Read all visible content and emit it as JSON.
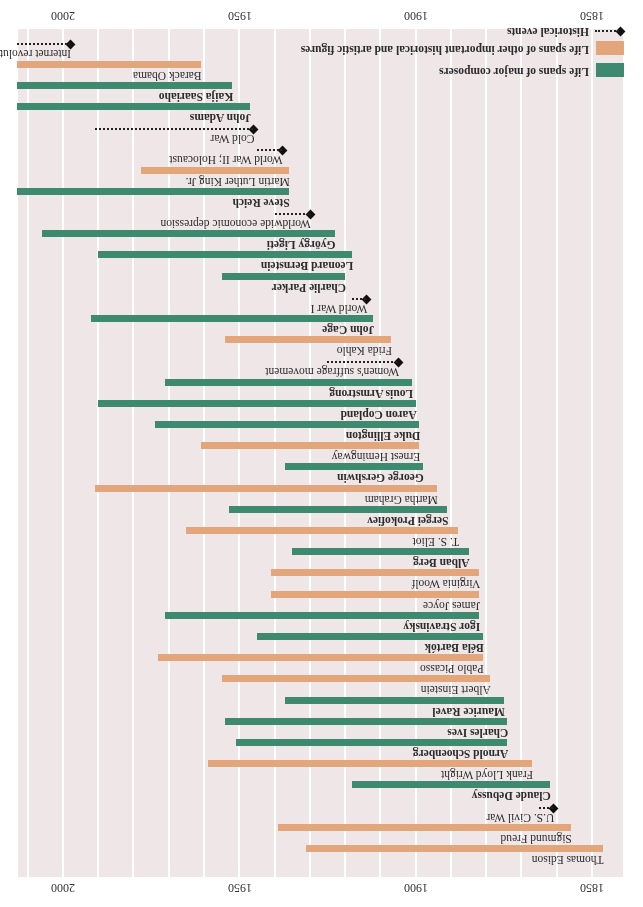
{
  "chart_data": {
    "type": "timeline",
    "title": "",
    "orientation_note": "rendered rotated 180 degrees",
    "xlabel": "",
    "ylabel": "",
    "x_range": [
      1842,
      2014
    ],
    "ticks": [
      1850,
      1900,
      1950,
      2000
    ],
    "grid_step_years": 10,
    "grid": true,
    "legend": [
      {
        "key": "composer",
        "label": "Life spans of major composers",
        "color": "#3d8a70"
      },
      {
        "key": "other",
        "label": "Life spans of other important historical and artistic figures",
        "color": "#e3a57a"
      },
      {
        "key": "event",
        "label": "Historical events",
        "color": "#111111"
      }
    ],
    "rows": [
      {
        "label": "Thomas Edison",
        "kind": "other",
        "start": 1847,
        "end": 1931
      },
      {
        "label": "Sigmund Freud",
        "kind": "other",
        "start": 1856,
        "end": 1939
      },
      {
        "label": "U.S. Civil War",
        "kind": "event",
        "start": 1861,
        "end": 1865
      },
      {
        "label": "Claude Debussy",
        "kind": "composer",
        "start": 1862,
        "end": 1918
      },
      {
        "label": "Frank Lloyd Wright",
        "kind": "other",
        "start": 1867,
        "end": 1959
      },
      {
        "label": "Arnold Schoenberg",
        "kind": "composer",
        "start": 1874,
        "end": 1951
      },
      {
        "label": "Charles Ives",
        "kind": "composer",
        "start": 1874,
        "end": 1954
      },
      {
        "label": "Maurice Ravel",
        "kind": "composer",
        "start": 1875,
        "end": 1937
      },
      {
        "label": "Albert Einstein",
        "kind": "other",
        "start": 1879,
        "end": 1955
      },
      {
        "label": "Pablo Picasso",
        "kind": "other",
        "start": 1881,
        "end": 1973
      },
      {
        "label": "Béla Bartók",
        "kind": "composer",
        "start": 1881,
        "end": 1945
      },
      {
        "label": "Igor Stravinsky",
        "kind": "composer",
        "start": 1882,
        "end": 1971
      },
      {
        "label": "James Joyce",
        "kind": "other",
        "start": 1882,
        "end": 1941
      },
      {
        "label": "Virginia Woolf",
        "kind": "other",
        "start": 1882,
        "end": 1941
      },
      {
        "label": "Alban Berg",
        "kind": "composer",
        "start": 1885,
        "end": 1935
      },
      {
        "label": "T. S. Eliot",
        "kind": "other",
        "start": 1888,
        "end": 1965
      },
      {
        "label": "Sergei Prokofiev",
        "kind": "composer",
        "start": 1891,
        "end": 1953
      },
      {
        "label": "Martha Graham",
        "kind": "other",
        "start": 1894,
        "end": 1991
      },
      {
        "label": "George Gershwin",
        "kind": "composer",
        "start": 1898,
        "end": 1937
      },
      {
        "label": "Ernest Hemingway",
        "kind": "other",
        "start": 1899,
        "end": 1961
      },
      {
        "label": "Duke Ellington",
        "kind": "composer",
        "start": 1899,
        "end": 1974
      },
      {
        "label": "Aaron Copland",
        "kind": "composer",
        "start": 1900,
        "end": 1990
      },
      {
        "label": "Louis Armstrong",
        "kind": "composer",
        "start": 1901,
        "end": 1971
      },
      {
        "label": "Women's suffrage movement",
        "kind": "event",
        "start": 1905,
        "end": 1925
      },
      {
        "label": "Frida Kahlo",
        "kind": "other",
        "start": 1907,
        "end": 1954
      },
      {
        "label": "John Cage",
        "kind": "composer",
        "start": 1912,
        "end": 1992
      },
      {
        "label": "World War I",
        "kind": "event",
        "start": 1914,
        "end": 1918
      },
      {
        "label": "Charlie Parker",
        "kind": "composer",
        "start": 1920,
        "end": 1955
      },
      {
        "label": "Leonard Bernstein",
        "kind": "composer",
        "start": 1918,
        "end": 1990
      },
      {
        "label": "György Ligeti",
        "kind": "composer",
        "start": 1923,
        "end": 2006
      },
      {
        "label": "Worldwide economic depression",
        "kind": "event",
        "start": 1930,
        "end": 1940
      },
      {
        "label": "Steve Reich",
        "kind": "composer",
        "start": 1936,
        "end": 2013
      },
      {
        "label": "Martin Luther King Jr.",
        "kind": "other",
        "start": 1936,
        "end": 1978
      },
      {
        "label": "World War II; Holocaust",
        "kind": "event",
        "start": 1938,
        "end": 1945
      },
      {
        "label": "Cold War",
        "kind": "event",
        "start": 1946,
        "end": 1991
      },
      {
        "label": "John Adams",
        "kind": "composer",
        "start": 1947,
        "end": 2013
      },
      {
        "label": "Kaija Saariaho",
        "kind": "composer",
        "start": 1952,
        "end": 2013
      },
      {
        "label": "Barack Obama",
        "kind": "other",
        "start": 1961,
        "end": 2013
      },
      {
        "label": "Internet revolution",
        "kind": "event",
        "start": 1998,
        "end": 2013
      }
    ]
  },
  "scale": {
    "x0_year": 1850,
    "x0_px": 51,
    "px_per_year": 3.527,
    "row_top_px": 42,
    "row_pitch_px": 21.2
  },
  "axis": {
    "tick_1850": "1850",
    "tick_1900": "1900",
    "tick_1950": "1950",
    "tick_2000": "2000"
  },
  "legend": {
    "composer": "Life spans of major composers",
    "other": "Life spans of other important historical and artistic figures",
    "event": "Historical events"
  }
}
